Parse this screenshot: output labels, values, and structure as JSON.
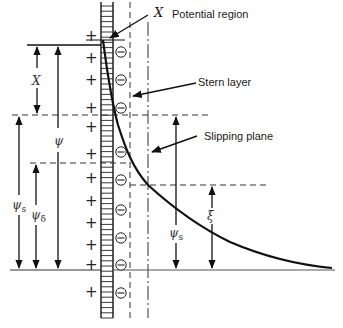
{
  "diagram": {
    "type": "electric double layer / zeta potential schematic",
    "labels": {
      "potential_region": "Potential region",
      "potential_region_symbol": "X",
      "stern_layer": "Stern layer",
      "slipping_plane": "Slipping plane"
    },
    "symbols": {
      "x": "X",
      "psi": "ψ",
      "psi_s_left": "ψ",
      "psi_s_left_sub": "s",
      "psi_delta": "ψ",
      "psi_delta_sub": "δ",
      "psi_s_right": "ψ",
      "psi_s_right_sub": "s",
      "zeta": "ξ"
    },
    "charges": {
      "positive": "+",
      "negative": "−"
    },
    "colors": {
      "ink": "#111111",
      "dashed": "#444444",
      "background": "#ffffff"
    }
  }
}
